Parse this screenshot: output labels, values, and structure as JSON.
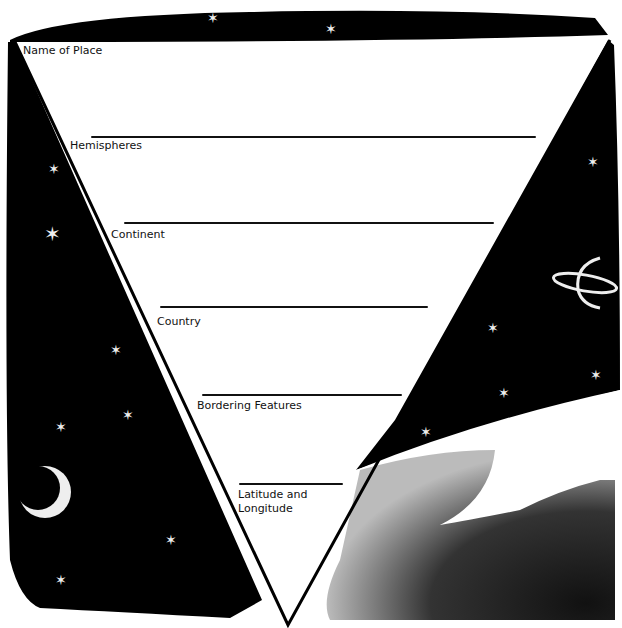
{
  "worksheet": {
    "fields": [
      {
        "label": "Name of Place"
      },
      {
        "label": "Hemispheres"
      },
      {
        "label": "Continent"
      },
      {
        "label": "Country"
      },
      {
        "label": "Bordering Features"
      },
      {
        "label": "Latitude and"
      },
      {
        "label": "Longitude"
      }
    ]
  },
  "colors": {
    "ink": "#000000",
    "paper": "#ffffff"
  },
  "icons": [
    "star-icon",
    "moon-icon",
    "planet-saturn-icon",
    "earth-icon"
  ]
}
